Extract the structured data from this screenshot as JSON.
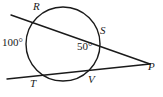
{
  "figure": {
    "kind": "circle-two-secants",
    "stroke_color": "#1a1a1a",
    "background_color": "#ffffff",
    "text_color": "#1a1a1a"
  },
  "points": {
    "R": {
      "label": "R",
      "x": 38,
      "y": 22
    },
    "S": {
      "label": "S",
      "x": 97,
      "y": 48
    },
    "T": {
      "label": "T",
      "x": 38,
      "y": 73
    },
    "V": {
      "label": "V",
      "x": 90,
      "y": 76
    },
    "P": {
      "label": "P",
      "x": 148,
      "y": 63
    }
  },
  "angles": {
    "arc_RT": {
      "label": "100°",
      "value": 100,
      "position": "outside-left"
    },
    "interior": {
      "label": "50°",
      "value": 50,
      "position": "inside-right"
    }
  },
  "circle": {
    "cx": 63,
    "cy": 44,
    "r": 37
  },
  "secants": [
    {
      "name": "secant-RSP",
      "from": {
        "x": 11,
        "y": 15
      },
      "to": {
        "x": 150,
        "y": 64
      },
      "through": [
        "R",
        "S",
        "P"
      ]
    },
    {
      "name": "secant-TVP",
      "from": {
        "x": 7,
        "y": 79
      },
      "to": {
        "x": 150,
        "y": 64
      },
      "through": [
        "T",
        "V",
        "P"
      ]
    }
  ]
}
